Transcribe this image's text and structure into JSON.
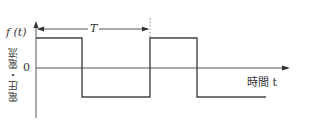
{
  "diagram": {
    "title": "",
    "y_axis_label": "f (t)",
    "y_axis_name": "電圧・電流",
    "x_axis_label": "時間 t",
    "zero_label": "0",
    "period_label": "T",
    "waveform": "square",
    "colors": {
      "line": "#444444",
      "background": "#ffffff",
      "dotted": "#888888"
    },
    "levels": {
      "high": 1,
      "low": -1
    },
    "segments": [
      {
        "from": 0,
        "to": 0.5,
        "level": "high"
      },
      {
        "from": 0.5,
        "to": 1.0,
        "level": "low"
      },
      {
        "from": 1.0,
        "to": 1.5,
        "level": "high"
      },
      {
        "from": 1.5,
        "to": 2.05,
        "level": "low"
      }
    ]
  }
}
